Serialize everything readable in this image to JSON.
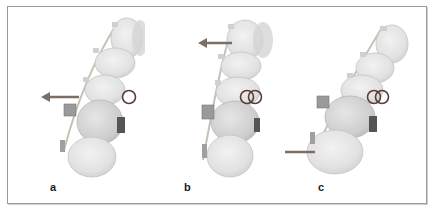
{
  "figure": {
    "panels": [
      {
        "id": "a",
        "label": "a",
        "arrow_direction": "left",
        "arrow_position": "middle",
        "ring_count": 1
      },
      {
        "id": "b",
        "label": "b",
        "arrow_direction": "left",
        "arrow_position": "top",
        "ring_count": 2
      },
      {
        "id": "c",
        "label": "c",
        "arrow_direction": "left",
        "arrow_position": "bottom",
        "ring_count": 2
      }
    ],
    "colors": {
      "frame": "#9a9a9a",
      "arrow": "#7a6e66",
      "ring": "#5a3f36",
      "tooth_fill": "#e6e6e6",
      "tooth_edge": "#bdbdbd",
      "bracket": "#8f8f8f",
      "wire": "#c9c0b4"
    }
  }
}
